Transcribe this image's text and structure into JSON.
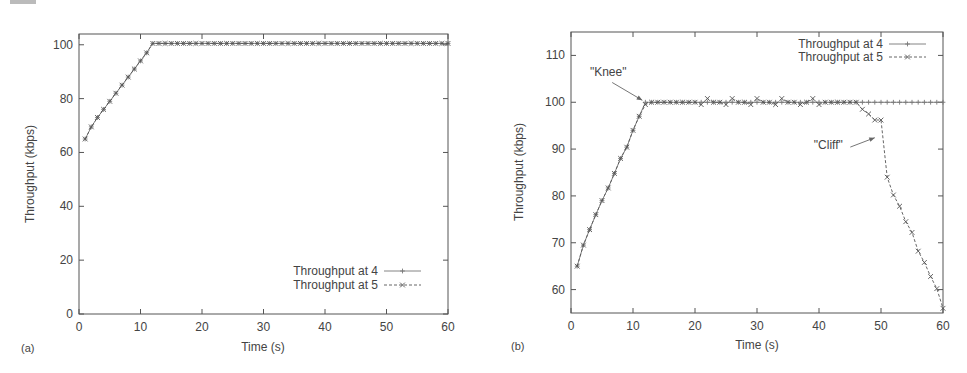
{
  "panels": [
    {
      "label": "(a)"
    },
    {
      "label": "(b)"
    }
  ],
  "chart_data": [
    {
      "type": "line",
      "panel": "(a)",
      "title": "",
      "xlabel": "Time (s)",
      "ylabel": "Throughput (kbps)",
      "xlim": [
        0,
        60
      ],
      "ylim": [
        0,
        104
      ],
      "xticks": [
        0,
        10,
        20,
        30,
        40,
        50,
        60
      ],
      "yticks": [
        0,
        20,
        40,
        60,
        80,
        100
      ],
      "grid": false,
      "legend_position": "lower right",
      "annotations": [],
      "series": [
        {
          "name": "Throughput at 4",
          "marker": "+",
          "linestyle": "solid",
          "x": [
            1,
            2,
            3,
            4,
            5,
            6,
            7,
            8,
            9,
            10,
            11,
            12,
            13,
            14,
            15,
            16,
            17,
            18,
            19,
            20,
            21,
            22,
            23,
            24,
            25,
            26,
            27,
            28,
            29,
            30,
            31,
            32,
            33,
            34,
            35,
            36,
            37,
            38,
            39,
            40,
            41,
            42,
            43,
            44,
            45,
            46,
            47,
            48,
            49,
            50,
            51,
            52,
            53,
            54,
            55,
            56,
            57,
            58,
            59,
            60
          ],
          "values": [
            65,
            69.5,
            73,
            76,
            79,
            82,
            85,
            88,
            91,
            94,
            97,
            100.5,
            100.5,
            100.5,
            100.5,
            100.5,
            100.5,
            100.5,
            100.5,
            100.5,
            100.5,
            100.5,
            100.5,
            100.5,
            100.5,
            100.5,
            100.5,
            100.5,
            100.5,
            100.5,
            100.5,
            100.5,
            100.5,
            100.5,
            100.5,
            100.5,
            100.5,
            100.5,
            100.5,
            100.5,
            100.5,
            100.5,
            100.5,
            100.5,
            100.5,
            100.5,
            100.5,
            100.5,
            100.5,
            100.5,
            100.5,
            100.5,
            100.5,
            100.5,
            100.5,
            100.5,
            100.5,
            100.5,
            100.5,
            100.5
          ]
        },
        {
          "name": "Throughput at 5",
          "marker": "x",
          "linestyle": "dashed",
          "x": [
            1,
            2,
            3,
            4,
            5,
            6,
            7,
            8,
            9,
            10,
            11,
            12,
            13,
            14,
            15,
            16,
            17,
            18,
            19,
            20,
            21,
            22,
            23,
            24,
            25,
            26,
            27,
            28,
            29,
            30,
            31,
            32,
            33,
            34,
            35,
            36,
            37,
            38,
            39,
            40,
            41,
            42,
            43,
            44,
            45,
            46,
            47,
            48,
            49,
            50,
            51,
            52,
            53,
            54,
            55,
            56,
            57,
            58,
            59,
            60
          ],
          "values": [
            65,
            69.5,
            73,
            76,
            79,
            82,
            85,
            88,
            91,
            94,
            97,
            100.5,
            100.5,
            100.5,
            100.5,
            100.5,
            100.5,
            100.5,
            100.5,
            100.5,
            100.5,
            100.5,
            100.5,
            100.5,
            100.5,
            100.5,
            100.5,
            100.5,
            100.5,
            100.5,
            100.5,
            100.5,
            100.5,
            100.5,
            100.5,
            100.5,
            100.5,
            100.5,
            100.5,
            100.5,
            100.5,
            100.5,
            100.5,
            100.5,
            100.5,
            100.5,
            100.5,
            100.5,
            100.5,
            100.5,
            100.5,
            100.5,
            100.5,
            100.5,
            100.5,
            100.5,
            100.5,
            100.5,
            100.5,
            100.5
          ]
        }
      ]
    },
    {
      "type": "line",
      "panel": "(b)",
      "title": "",
      "xlabel": "Time (s)",
      "ylabel": "Throughput (kbps)",
      "xlim": [
        0,
        60
      ],
      "ylim": [
        55,
        115
      ],
      "xticks": [
        0,
        10,
        20,
        30,
        40,
        50,
        60
      ],
      "yticks": [
        60,
        70,
        80,
        90,
        100,
        110
      ],
      "grid": false,
      "legend_position": "upper right",
      "annotations": [
        {
          "text": "\"Knee\"",
          "x": 11.5,
          "y": 100,
          "text_x": 6,
          "text_y": 105.5
        },
        {
          "text": "\"Cliff\"",
          "x": 49,
          "y": 92,
          "text_x": 41.5,
          "text_y": 90
        }
      ],
      "series": [
        {
          "name": "Throughput at 4",
          "marker": "+",
          "linestyle": "solid",
          "x": [
            1,
            2,
            3,
            4,
            5,
            6,
            7,
            8,
            9,
            10,
            11,
            12,
            13,
            14,
            15,
            16,
            17,
            18,
            19,
            20,
            21,
            22,
            23,
            24,
            25,
            26,
            27,
            28,
            29,
            30,
            31,
            32,
            33,
            34,
            35,
            36,
            37,
            38,
            39,
            40,
            41,
            42,
            43,
            44,
            45,
            46,
            47,
            48,
            49,
            50,
            51,
            52,
            53,
            54,
            55,
            56,
            57,
            58,
            59,
            60
          ],
          "values": [
            65,
            69.5,
            72.8,
            76,
            79,
            81.7,
            84.8,
            88,
            90.4,
            94,
            97,
            100,
            100,
            100,
            100,
            100,
            100,
            100,
            100,
            100,
            100,
            100,
            100,
            100,
            100,
            100,
            100,
            100,
            100,
            100,
            100,
            100,
            100,
            100,
            100,
            100,
            100,
            100,
            100,
            100,
            100,
            100,
            100,
            100,
            100,
            100,
            100,
            100,
            100,
            100,
            100,
            100,
            100,
            100,
            100,
            100,
            100,
            100,
            100,
            100
          ]
        },
        {
          "name": "Throughput at 5",
          "marker": "x",
          "linestyle": "dashed",
          "x": [
            1,
            2,
            3,
            4,
            5,
            6,
            7,
            8,
            9,
            10,
            11,
            12,
            13,
            14,
            15,
            16,
            17,
            18,
            19,
            20,
            21,
            22,
            23,
            24,
            25,
            26,
            27,
            28,
            29,
            30,
            31,
            32,
            33,
            34,
            35,
            36,
            37,
            38,
            39,
            40,
            41,
            42,
            43,
            44,
            45,
            46,
            47,
            48,
            49,
            50,
            51,
            52,
            53,
            54,
            55,
            56,
            57,
            58,
            59,
            60
          ],
          "values": [
            65,
            69.5,
            72.8,
            76,
            79,
            81.7,
            84.8,
            88,
            90.4,
            94,
            97,
            99.5,
            100,
            100,
            100,
            100,
            100,
            100,
            100,
            100,
            99.5,
            100.8,
            100,
            100,
            99.5,
            100.8,
            100,
            100,
            99.5,
            100.8,
            100,
            100,
            99.5,
            100.8,
            100,
            100,
            99.5,
            100,
            100.8,
            99.5,
            100,
            100,
            100,
            100,
            100,
            100,
            98.5,
            97.5,
            96.2,
            96.2,
            84,
            80.2,
            77.8,
            74.5,
            72.2,
            68.2,
            65.8,
            62.8,
            60.2,
            56
          ]
        }
      ]
    }
  ]
}
